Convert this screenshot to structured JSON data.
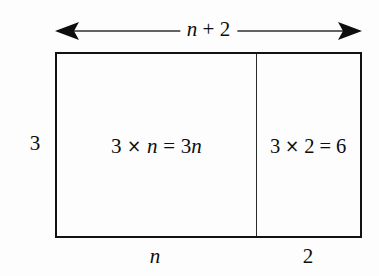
{
  "figure": {
    "background_color": "#fdfdfd",
    "line_color": "#121212",
    "divider_color": "#2a2a2a"
  },
  "top_dimension": {
    "label_full": "n + 2",
    "label_variable": "n",
    "label_rest": " + 2",
    "arrow_left_icon": "arrow-left-icon",
    "arrow_right_icon": "arrow-right-icon"
  },
  "height_label": "3",
  "cells": [
    {
      "id": "left",
      "expression_full": "3 × n = 3n",
      "factor_a": "3",
      "times": "×",
      "factor_b": "n",
      "equals": "=",
      "product": "3n",
      "bottom_label": "n",
      "width_px": 200
    },
    {
      "id": "right",
      "expression_full": "3 × 2 = 6",
      "factor_a": "3",
      "times": "×",
      "factor_b": "2",
      "equals": "=",
      "product": "6",
      "bottom_label": "2",
      "width_px": 102
    }
  ],
  "bottom_labels": {
    "left": "n",
    "right": "2"
  }
}
